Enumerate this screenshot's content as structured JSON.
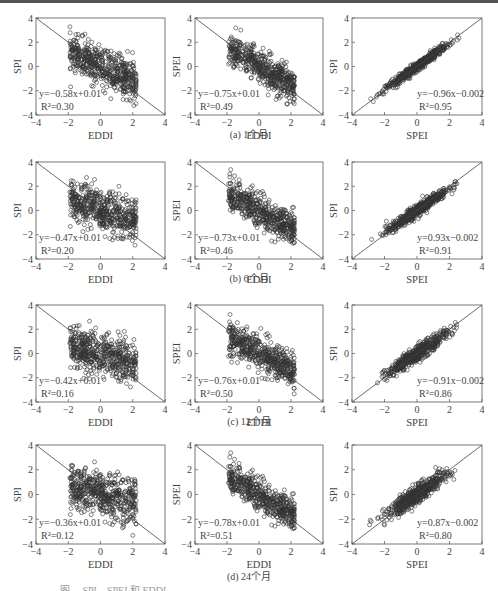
{
  "figure": {
    "captions": [
      "(a) 1个月",
      "(b) 6个月",
      "(c) 12个月",
      "(d) 24个月"
    ],
    "bottom_caption_fragment": "图 ... SPI、SPEI 和 EDDI ..."
  },
  "chart_data": [
    {
      "type": "scatter",
      "panel": "a1",
      "xlabel": "EDDI",
      "ylabel": "SPI",
      "xlim": [
        -4,
        4
      ],
      "ylim": [
        -4,
        4
      ],
      "xticks": [
        -4,
        -2,
        0,
        2,
        4
      ],
      "yticks": [
        -4,
        -2,
        0,
        2,
        4
      ],
      "fit": {
        "slope": -0.58,
        "intercept": 0.01
      },
      "equation": "y=−0.58x+0.01",
      "r2_label": "R²=0.30",
      "r2": 0.3,
      "reference_line": "1:-1",
      "eq_pos": "bottom-left"
    },
    {
      "type": "scatter",
      "panel": "a2",
      "xlabel": "EDDI",
      "ylabel": "SPEI",
      "xlim": [
        -4,
        4
      ],
      "ylim": [
        -4,
        4
      ],
      "xticks": [
        -4,
        -2,
        0,
        2,
        4
      ],
      "yticks": [
        -4,
        -2,
        0,
        2,
        4
      ],
      "fit": {
        "slope": -0.75,
        "intercept": 0.01
      },
      "equation": "y=−0.75x+0.01",
      "r2_label": "R²=0.49",
      "r2": 0.49,
      "reference_line": "1:-1",
      "eq_pos": "bottom-left"
    },
    {
      "type": "scatter",
      "panel": "a3",
      "xlabel": "SPEI",
      "ylabel": "SPI",
      "xlim": [
        -4,
        4
      ],
      "ylim": [
        -4,
        4
      ],
      "xticks": [
        -4,
        -2,
        0,
        2,
        4
      ],
      "yticks": [
        -4,
        -2,
        0,
        2,
        4
      ],
      "fit": {
        "slope": 0.96,
        "intercept": -0.002
      },
      "equation": "y=−0.96x−0.002",
      "r2_label": "R²=0.95",
      "r2": 0.95,
      "reference_line": "1:1",
      "eq_pos": "bottom-right"
    },
    {
      "type": "scatter",
      "panel": "b1",
      "xlabel": "EDDI",
      "ylabel": "SPI",
      "xlim": [
        -4,
        4
      ],
      "ylim": [
        -4,
        4
      ],
      "xticks": [
        -4,
        -2,
        0,
        2,
        4
      ],
      "yticks": [
        -4,
        -2,
        0,
        2,
        4
      ],
      "fit": {
        "slope": -0.47,
        "intercept": 0.01
      },
      "equation": "y=−0.47x+0.01",
      "r2_label": "R²=0.20",
      "r2": 0.2,
      "reference_line": "1:-1",
      "eq_pos": "bottom-left"
    },
    {
      "type": "scatter",
      "panel": "b2",
      "xlabel": "EDDI",
      "ylabel": "SPEI",
      "xlim": [
        -4,
        4
      ],
      "ylim": [
        -4,
        4
      ],
      "xticks": [
        -4,
        -2,
        0,
        2,
        4
      ],
      "yticks": [
        -4,
        -2,
        0,
        2,
        4
      ],
      "fit": {
        "slope": -0.73,
        "intercept": 0.01
      },
      "equation": "y=−0.73x+0.01",
      "r2_label": "R²=0.46",
      "r2": 0.46,
      "reference_line": "1:-1",
      "eq_pos": "bottom-left"
    },
    {
      "type": "scatter",
      "panel": "b3",
      "xlabel": "SPEI",
      "ylabel": "SPI",
      "xlim": [
        -4,
        4
      ],
      "ylim": [
        -4,
        4
      ],
      "xticks": [
        -4,
        -2,
        0,
        2,
        4
      ],
      "yticks": [
        -4,
        -2,
        0,
        2,
        4
      ],
      "fit": {
        "slope": 0.93,
        "intercept": -0.002
      },
      "equation": "y=0.93x−0.002",
      "r2_label": "R²=0.91",
      "r2": 0.91,
      "reference_line": "1:1",
      "eq_pos": "bottom-right"
    },
    {
      "type": "scatter",
      "panel": "c1",
      "xlabel": "EDDI",
      "ylabel": "SPI",
      "xlim": [
        -4,
        4
      ],
      "ylim": [
        -4,
        4
      ],
      "xticks": [
        -4,
        -2,
        0,
        2,
        4
      ],
      "yticks": [
        -4,
        -2,
        0,
        2,
        4
      ],
      "fit": {
        "slope": -0.42,
        "intercept": 0.01
      },
      "equation": "y=−0.42x+0.01",
      "r2_label": "R²=0.16",
      "r2": 0.16,
      "reference_line": "1:-1",
      "eq_pos": "bottom-left"
    },
    {
      "type": "scatter",
      "panel": "c2",
      "xlabel": "EDDI",
      "ylabel": "SPEI",
      "xlim": [
        -4,
        4
      ],
      "ylim": [
        -4,
        4
      ],
      "xticks": [
        -4,
        -2,
        0,
        2,
        4
      ],
      "yticks": [
        -4,
        -2,
        0,
        2,
        4
      ],
      "fit": {
        "slope": -0.76,
        "intercept": 0.01
      },
      "equation": "y=−0.76x+0.01",
      "r2_label": "R²=0.50",
      "r2": 0.5,
      "reference_line": "1:-1",
      "eq_pos": "bottom-left"
    },
    {
      "type": "scatter",
      "panel": "c3",
      "xlabel": "SPEI",
      "ylabel": "SPI",
      "xlim": [
        -4,
        4
      ],
      "ylim": [
        -4,
        4
      ],
      "xticks": [
        -4,
        -2,
        0,
        2,
        4
      ],
      "yticks": [
        -4,
        -2,
        0,
        2,
        4
      ],
      "fit": {
        "slope": 0.91,
        "intercept": -0.002
      },
      "equation": "y=−0.91x−0.002",
      "r2_label": "R²=0.86",
      "r2": 0.86,
      "reference_line": "1:1",
      "eq_pos": "bottom-right"
    },
    {
      "type": "scatter",
      "panel": "d1",
      "xlabel": "EDDI",
      "ylabel": "SPI",
      "xlim": [
        -4,
        4
      ],
      "ylim": [
        -4,
        4
      ],
      "xticks": [
        -4,
        -2,
        0,
        2,
        4
      ],
      "yticks": [
        -4,
        -2,
        0,
        2,
        4
      ],
      "fit": {
        "slope": -0.36,
        "intercept": 0.01
      },
      "equation": "y=−0.36x+0.01",
      "r2_label": "R²=0.12",
      "r2": 0.12,
      "reference_line": "1:-1",
      "eq_pos": "bottom-left"
    },
    {
      "type": "scatter",
      "panel": "d2",
      "xlabel": "EDDI",
      "ylabel": "SPEI",
      "xlim": [
        -4,
        4
      ],
      "ylim": [
        -4,
        4
      ],
      "xticks": [
        -4,
        -2,
        0,
        2,
        4
      ],
      "yticks": [
        -4,
        -2,
        0,
        2,
        4
      ],
      "fit": {
        "slope": -0.78,
        "intercept": 0.01
      },
      "equation": "y=−0.78x+0.01",
      "r2_label": "R²=0.51",
      "r2": 0.51,
      "reference_line": "1:-1",
      "eq_pos": "bottom-left"
    },
    {
      "type": "scatter",
      "panel": "d3",
      "xlabel": "SPEI",
      "ylabel": "SPI",
      "xlim": [
        -4,
        4
      ],
      "ylim": [
        -4,
        4
      ],
      "xticks": [
        -4,
        -2,
        0,
        2,
        4
      ],
      "yticks": [
        -4,
        -2,
        0,
        2,
        4
      ],
      "fit": {
        "slope": 0.87,
        "intercept": -0.002
      },
      "equation": "y=0.87x−0.002",
      "r2_label": "R²=0.80",
      "r2": 0.8,
      "reference_line": "1:1",
      "eq_pos": "bottom-right"
    }
  ]
}
